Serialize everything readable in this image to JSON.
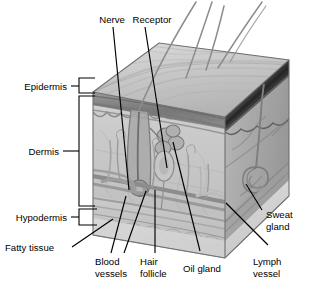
{
  "figure": {
    "background_color": "#ffffff",
    "text_color": "#000000",
    "leader_line_color": "#000000"
  },
  "labels": {
    "epidermis": "Epidermis",
    "dermis": "Dermis",
    "hypodermis": "Hypodermis",
    "fatty_tissue": "Fatty tissue",
    "nerve": "Nerve",
    "receptor": "Receptor",
    "blood_vessels_line1": "Blood",
    "blood_vessels_line2": "vessels",
    "hair_follicle_line1": "Hair",
    "hair_follicle_line2": "follicle",
    "oil_gland": "Oil gland",
    "lymph_vessel_line1": "Lymph",
    "lymph_vessel_line2": "vessel",
    "sweat_gland_line1": "Sweat",
    "sweat_gland_line2": "gland"
  },
  "layers": [
    {
      "name": "Epidermis",
      "position": "left-bracket-top"
    },
    {
      "name": "Dermis",
      "position": "left-bracket-middle"
    },
    {
      "name": "Hypodermis",
      "position": "left-bracket-bottom"
    }
  ],
  "structures": [
    {
      "name": "Nerve",
      "position": "top-left-callout"
    },
    {
      "name": "Receptor",
      "position": "top-center-callout"
    },
    {
      "name": "Fatty tissue",
      "position": "lower-left-callout"
    },
    {
      "name": "Blood vessels",
      "position": "bottom-callout"
    },
    {
      "name": "Hair follicle",
      "position": "bottom-callout"
    },
    {
      "name": "Oil gland",
      "position": "bottom-callout"
    },
    {
      "name": "Lymph vessel",
      "position": "bottom-right-callout"
    },
    {
      "name": "Sweat gland",
      "position": "right-callout"
    }
  ]
}
